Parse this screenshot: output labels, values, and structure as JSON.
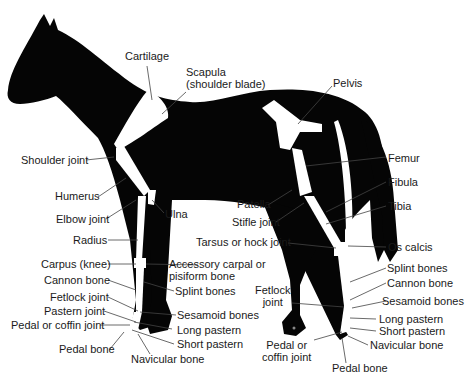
{
  "diagram": {
    "colors": {
      "silhouette": "#050505",
      "bone": "#ffffff",
      "leader": "#ffffff",
      "text": "#1a1a1a",
      "background": "#ffffff"
    },
    "labels": {
      "cartilage": "Cartilage",
      "scapula": "Scapula\n(shoulder blade)",
      "pelvis": "Pelvis",
      "shoulder_joint": "Shoulder joint",
      "femur": "Femur",
      "humerus": "Humerus",
      "fibula": "Fibula",
      "patella": "Patella",
      "elbow_joint": "Elbow joint",
      "ulna": "Ulna",
      "tibia": "Tibia",
      "stifle_joint": "Stifle joint",
      "radius": "Radius",
      "tarsus": "Tarsus or hock joint",
      "os_calcis": "Os calcis",
      "carpus": "Carpus (knee)",
      "accessory_carpal": "Accessory carpal or\npisiform bone",
      "splint_bones_hind": "Splint bones",
      "cannon_bone_fore": "Cannon bone",
      "splint_bones_fore": "Splint bones",
      "fetlock_joint_hind": "Fetlock\njoint",
      "cannon_bone_hind": "Cannon bone",
      "fetlock_joint_fore": "Fetlock joint",
      "sesamoid_bones_hind": "Sesamoid bones",
      "pastern_joint": "Pastern joint",
      "sesamoid_bones_fore": "Sesamoid bones",
      "pedal_coffin_joint_fore": "Pedal or coffin joint",
      "long_pastern_hind": "Long pastern",
      "long_pastern_fore": "Long pastern",
      "short_pastern_hind": "Short pastern",
      "short_pastern_fore": "Short pastern",
      "pedal_coffin_joint_hind": "Pedal or\ncoffin joint",
      "navicular_bone_hind": "Navicular bone",
      "pedal_bone_fore": "Pedal bone",
      "navicular_bone_fore": "Navicular bone",
      "pedal_bone_hind": "Pedal bone"
    }
  }
}
